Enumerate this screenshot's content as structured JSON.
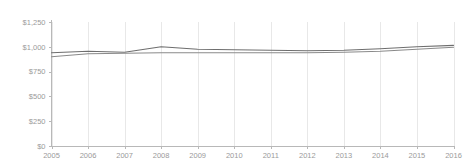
{
  "chart_data": {
    "type": "line",
    "title": "",
    "subtitle": "",
    "xlabel": "",
    "ylabel": "",
    "categories": [
      "2005",
      "2006",
      "2007",
      "2008",
      "2009",
      "2010",
      "2011",
      "2012",
      "2013",
      "2014",
      "2015",
      "2016"
    ],
    "x": [
      2005,
      2006,
      2007,
      2008,
      2009,
      2010,
      2011,
      2012,
      2013,
      2014,
      2015,
      2016
    ],
    "xlim": [
      2005,
      2016
    ],
    "ylim": [
      0,
      1250
    ],
    "y_ticks": [
      0,
      250,
      500,
      750,
      1000,
      1250
    ],
    "y_tick_labels": [
      "$0",
      "$250",
      "$500",
      "$750",
      "$1,000",
      "$1,250"
    ],
    "x_tick_labels": [
      "2005",
      "2006",
      "2007",
      "2008",
      "2009",
      "2010",
      "2011",
      "2012",
      "2013",
      "2014",
      "2015",
      "2016"
    ],
    "grid": "vertical",
    "legend": "none",
    "series": [
      {
        "name": "Series 1",
        "color": "#6e6e6e",
        "values": [
          940,
          955,
          945,
          1000,
          975,
          970,
          965,
          960,
          965,
          980,
          1000,
          1015
        ]
      },
      {
        "name": "Series 2",
        "color": "#8a8a8a",
        "values": [
          900,
          930,
          935,
          940,
          940,
          940,
          940,
          940,
          945,
          955,
          975,
          995
        ]
      }
    ],
    "annotations": []
  },
  "colors": {
    "background": "#ffffff",
    "gridline": "#e8e8e8",
    "axis": "#b8b8b8",
    "tick_text": "#9a9a9a",
    "series_1": "#6e6e6e",
    "series_2": "#8a8a8a"
  }
}
